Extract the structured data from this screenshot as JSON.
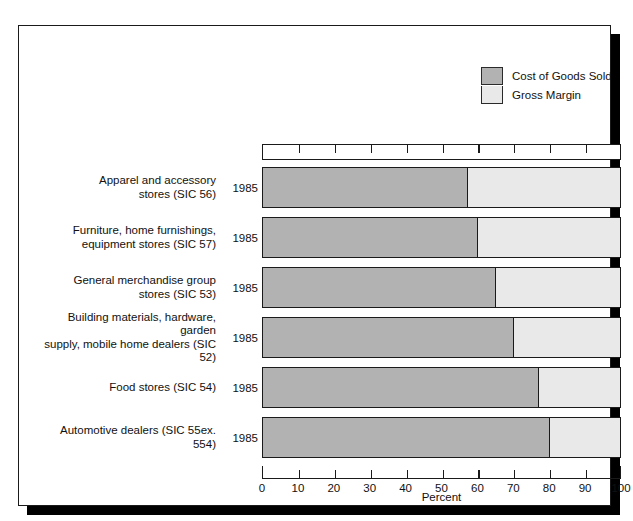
{
  "legend": {
    "entries": [
      {
        "label": "Cost of Goods Sold",
        "color": "#b2b2b2",
        "key": "cogs"
      },
      {
        "label": "Gross Margin",
        "color": "#e9e9e9",
        "key": "gross_margin"
      }
    ]
  },
  "axis": {
    "title": "Percent",
    "ticks": [
      "0",
      "10",
      "20",
      "30",
      "40",
      "50",
      "60",
      "70",
      "80",
      "90",
      "100"
    ]
  },
  "chart_data": {
    "type": "bar",
    "orientation": "horizontal",
    "stacked": true,
    "title": "",
    "xlabel": "Percent",
    "ylabel": "",
    "xlim": [
      0,
      100
    ],
    "grid": false,
    "legend_position": "top-right",
    "categories": [
      "Apparel and accessory stores (SIC 56)",
      "Furniture, home furnishings, equipment stores (SIC 57)",
      "General merchandise group stores (SIC 53)",
      "Building materials, hardware, garden supply, mobile home dealers (SIC 52)",
      "Food stores (SIC 54)",
      "Automotive dealers (SIC 55ex. 554)"
    ],
    "category_lines": [
      [
        "Apparel and accessory",
        "stores (SIC 56)"
      ],
      [
        "Furniture, home furnishings,",
        "equipment stores (SIC 57)"
      ],
      [
        "General merchandise group",
        "stores (SIC 53)"
      ],
      [
        "Building materials, hardware, garden",
        "supply, mobile home dealers (SIC 52)"
      ],
      [
        "Food stores (SIC 54)"
      ],
      [
        "Automotive dealers (SIC 55ex. 554)"
      ]
    ],
    "years": [
      "1985",
      "1985",
      "1985",
      "1985",
      "1985",
      "1985"
    ],
    "series": [
      {
        "name": "Cost of Goods Sold",
        "color": "#b2b2b2",
        "values": [
          57,
          60,
          65,
          70,
          77,
          80
        ]
      },
      {
        "name": "Gross Margin",
        "color": "#e9e9e9",
        "values": [
          43,
          40,
          35,
          30,
          23,
          20
        ]
      }
    ]
  }
}
